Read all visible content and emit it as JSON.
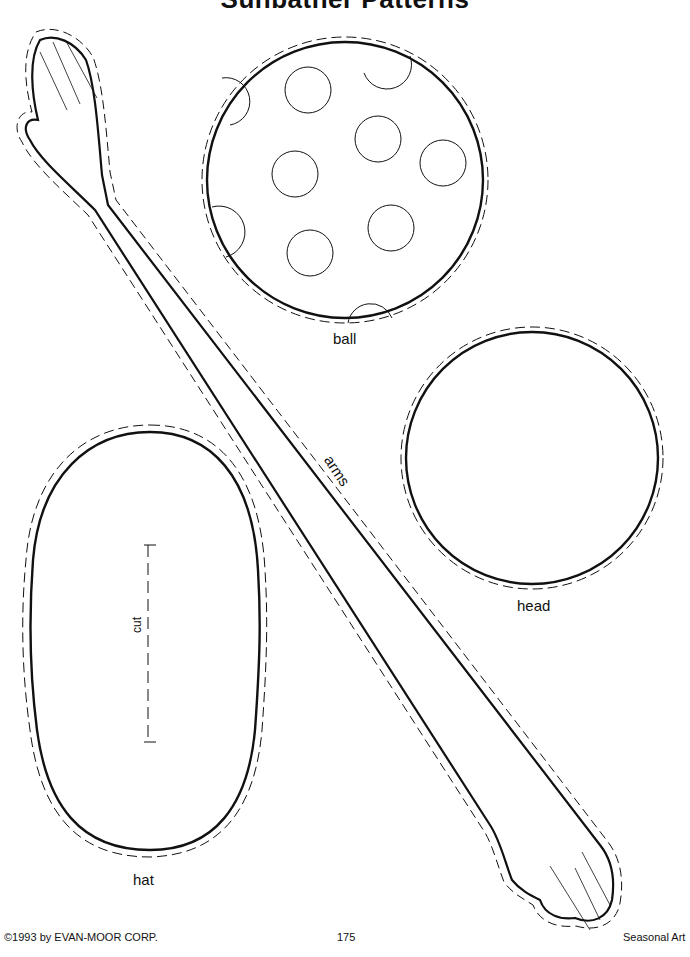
{
  "page": {
    "title": "Sunbather Patterns",
    "number": "175"
  },
  "patterns": {
    "ball": {
      "label": "ball"
    },
    "head": {
      "label": "head"
    },
    "arms": {
      "label": "arms"
    },
    "hat": {
      "label": "hat",
      "cut_label": "cut"
    }
  },
  "footer": {
    "copyright": "©1993 by EVAN-MOOR CORP.",
    "page_number": "175",
    "book_title": "Seasonal Art"
  }
}
